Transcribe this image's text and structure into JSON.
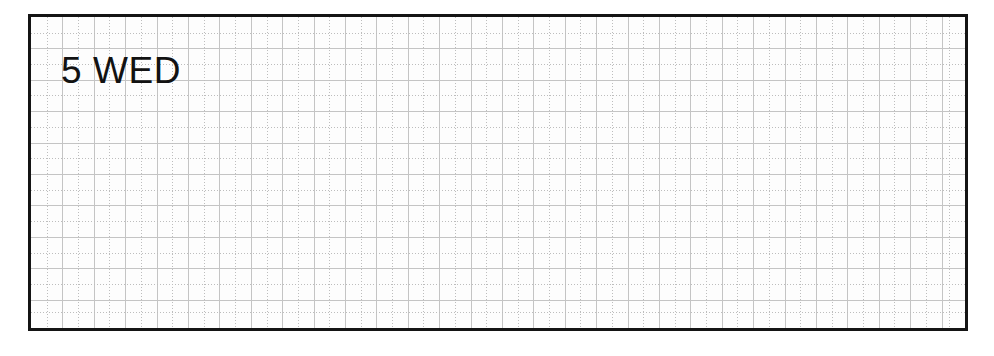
{
  "page": {
    "kind": "planner-day-page",
    "background_color": "#ffffff"
  },
  "frame": {
    "border_color": "#141414",
    "paper_color": "#fdfdfd"
  },
  "grid": {
    "major_line_color": "#c4c4c4",
    "dotted_line_color": "#bdbdbd",
    "cell_size_px": 31.4,
    "columns": 30,
    "rows": 10
  },
  "heading": {
    "day_number": "5",
    "weekday": "WED",
    "text_color": "#121212"
  }
}
